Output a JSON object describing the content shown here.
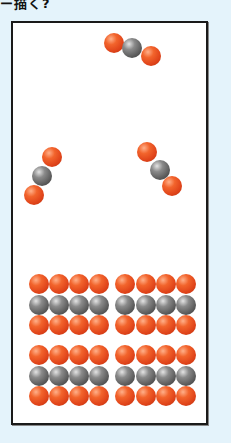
{
  "caption": "ー描く?",
  "diagram": {
    "frame": {
      "background": "#ffffff",
      "border": "#1a1a1a"
    },
    "colors": {
      "oxygen": "#e8501f",
      "carbon": "#6a6a6a"
    },
    "gas_molecules": [
      {
        "name": "top",
        "atoms": [
          {
            "el": "o",
            "x": 114,
            "y": 43
          },
          {
            "el": "c",
            "x": 132,
            "y": 48
          },
          {
            "el": "o",
            "x": 151,
            "y": 56
          }
        ]
      },
      {
        "name": "left",
        "atoms": [
          {
            "el": "o",
            "x": 52,
            "y": 157
          },
          {
            "el": "c",
            "x": 42,
            "y": 176
          },
          {
            "el": "o",
            "x": 34,
            "y": 195
          }
        ]
      },
      {
        "name": "right",
        "atoms": [
          {
            "el": "o",
            "x": 147,
            "y": 152
          },
          {
            "el": "c",
            "x": 160,
            "y": 170
          },
          {
            "el": "o",
            "x": 172,
            "y": 186
          }
        ]
      }
    ],
    "solid_lattice": {
      "columns_x": [
        39,
        59,
        79,
        99,
        125,
        146,
        166,
        186
      ],
      "rows": [
        {
          "y": 284,
          "el": "o"
        },
        {
          "y": 305,
          "el": "c"
        },
        {
          "y": 325,
          "el": "o"
        },
        {
          "y": 355,
          "el": "o"
        },
        {
          "y": 376,
          "el": "c"
        },
        {
          "y": 396,
          "el": "o"
        }
      ]
    }
  }
}
